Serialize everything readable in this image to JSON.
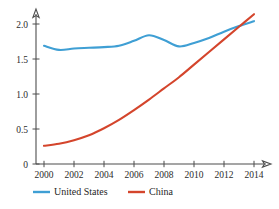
{
  "chart_data": {
    "type": "line",
    "title": "",
    "subtitle": "",
    "xlabel": "",
    "ylabel": "",
    "x": [
      2000,
      2001,
      2002,
      2003,
      2004,
      2005,
      2006,
      2007,
      2008,
      2009,
      2010,
      2011,
      2012,
      2013,
      2014
    ],
    "xlim": [
      2000,
      2014.6
    ],
    "ylim": [
      0,
      2.2
    ],
    "grid": false,
    "legend_position": "bottom",
    "x_ticks": [
      2000,
      2002,
      2004,
      2006,
      2008,
      2010,
      2012,
      2014
    ],
    "x_tick_labels": [
      "2000",
      "2002",
      "2004",
      "2006",
      "2008",
      "2010",
      "2012",
      "2014"
    ],
    "x_minor_ticks": [
      2001,
      2003,
      2005,
      2007,
      2009,
      2011,
      2013
    ],
    "y_ticks": [
      0,
      0.5,
      1.0,
      1.5,
      2.0
    ],
    "y_tick_labels": [
      "0",
      "0.5",
      "1.0",
      "1.5",
      "2.0"
    ],
    "series": [
      {
        "name": "United States",
        "color": "#3f9fd4",
        "values": [
          1.69,
          1.63,
          1.65,
          1.66,
          1.67,
          1.69,
          1.76,
          1.84,
          1.77,
          1.68,
          1.73,
          1.8,
          1.89,
          1.97,
          2.04
        ]
      },
      {
        "name": "China",
        "color": "#d4452c",
        "values": [
          0.26,
          0.29,
          0.34,
          0.41,
          0.51,
          0.63,
          0.77,
          0.92,
          1.08,
          1.24,
          1.42,
          1.6,
          1.78,
          1.96,
          2.14
        ]
      }
    ]
  },
  "legend": {
    "items": [
      {
        "label": "United States",
        "color": "#3f9fd4"
      },
      {
        "label": "China",
        "color": "#d4452c"
      }
    ]
  },
  "axes": {
    "x_axis_name": "year-axis",
    "y_axis_name": "value-axis",
    "arrow_caps": true
  }
}
